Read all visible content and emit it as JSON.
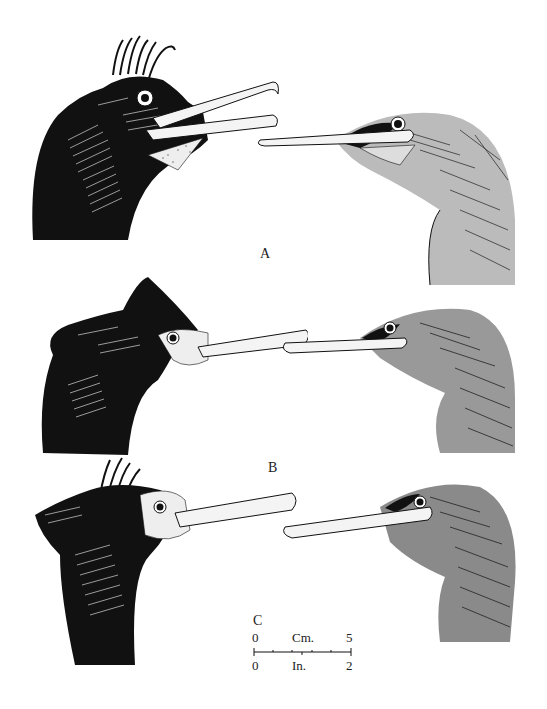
{
  "plate": {
    "background": "#ffffff",
    "ink": "#111111",
    "panels": [
      {
        "id": "A",
        "label": "A",
        "left_head": "dark-crested-breeding-head",
        "right_head": "pale-grey-juvenile-head"
      },
      {
        "id": "B",
        "label": "B",
        "left_head": "dark-double-crested-head",
        "right_head": "grey-streaked-juvenile-head"
      },
      {
        "id": "C",
        "label": "C",
        "left_head": "dark-tufted-head-with-stippled-face",
        "right_head": "grey-streaked-head"
      }
    ],
    "scale_bar": {
      "top_unit": "Cm.",
      "top_start": "0",
      "top_end": "5",
      "bottom_unit": "In.",
      "bottom_start": "0",
      "bottom_end": "2"
    }
  }
}
